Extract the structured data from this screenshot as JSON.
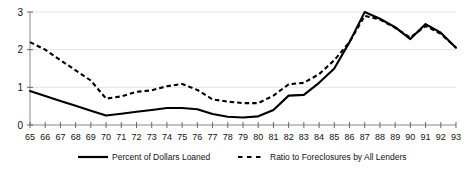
{
  "chart_data": {
    "type": "line",
    "title": "",
    "subtitle": "",
    "xlabel": "",
    "ylabel": "",
    "xlim": [
      65,
      93
    ],
    "ylim": [
      0,
      3
    ],
    "yticks": [
      0,
      1,
      2,
      3
    ],
    "ytick_labels": [
      "0",
      "1",
      "2",
      "3"
    ],
    "grid": "horizontal",
    "legend_position": "bottom",
    "categories": [
      65,
      66,
      67,
      68,
      69,
      70,
      71,
      72,
      73,
      74,
      75,
      76,
      77,
      78,
      79,
      80,
      81,
      82,
      83,
      84,
      85,
      86,
      87,
      88,
      89,
      90,
      91,
      92,
      93
    ],
    "xtick_labels": [
      "65",
      "66",
      "67",
      "68",
      "69",
      "70",
      "71",
      "72",
      "73",
      "74",
      "75",
      "76",
      "77",
      "78",
      "79",
      "80",
      "81",
      "82",
      "83",
      "84",
      "85",
      "86",
      "87",
      "88",
      "89",
      "90",
      "91",
      "92",
      "93"
    ],
    "series": [
      {
        "name": "Percent of Dollars Loaned",
        "style": "solid",
        "color": "#000000",
        "values": [
          0.9,
          0.77,
          0.64,
          0.51,
          0.38,
          0.25,
          0.3,
          0.35,
          0.4,
          0.45,
          0.45,
          0.42,
          0.29,
          0.22,
          0.2,
          0.23,
          0.4,
          0.78,
          0.8,
          1.12,
          1.5,
          2.2,
          3.0,
          2.82,
          2.6,
          2.28,
          2.68,
          2.45,
          2.05
        ]
      },
      {
        "name": "Ratio to Foreclosures by All Lenders",
        "style": "dashed",
        "color": "#000000",
        "values": [
          2.2,
          2.0,
          1.72,
          1.45,
          1.18,
          0.7,
          0.76,
          0.88,
          0.92,
          1.03,
          1.09,
          0.93,
          0.68,
          0.62,
          0.58,
          0.58,
          0.78,
          1.08,
          1.12,
          1.35,
          1.72,
          2.2,
          2.9,
          2.8,
          2.58,
          2.32,
          2.63,
          2.42,
          2.05
        ]
      }
    ]
  },
  "legend": {
    "items": [
      {
        "label": "Percent of Dollars Loaned",
        "style": "solid"
      },
      {
        "label": "Ratio to Foreclosures by All Lenders",
        "style": "dashed"
      }
    ]
  }
}
